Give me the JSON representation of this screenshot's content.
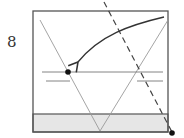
{
  "step": {
    "number": "8"
  },
  "diagram": {
    "colors": {
      "outline": "#555555",
      "thin_line": "#9a9a9a",
      "band_fill": "#e6e6e6",
      "arrow": "#333333",
      "dot": "#111111"
    },
    "elements": [
      "outer-square",
      "bottom-band",
      "v-left-line",
      "v-right-line",
      "crease-line-upper",
      "crease-line-lower",
      "dashed-fold-line",
      "curved-arrow",
      "reference-dot-left",
      "reference-dot-corner"
    ]
  }
}
